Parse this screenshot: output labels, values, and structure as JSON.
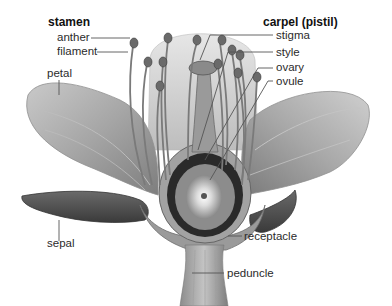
{
  "diagram": {
    "groups": {
      "stamen": {
        "heading": "stamen",
        "parts": [
          "anther",
          "filament"
        ]
      },
      "carpel": {
        "heading": "carpel (pistil)",
        "parts": [
          "stigma",
          "style",
          "ovary",
          "ovule"
        ]
      }
    },
    "labels": {
      "stamen": "stamen",
      "anther": "anther",
      "filament": "filament",
      "petal": "petal",
      "sepal": "sepal",
      "carpel": "carpel (pistil)",
      "stigma": "stigma",
      "style": "style",
      "ovary": "ovary",
      "ovule": "ovule",
      "receptacle": "receptacle",
      "peduncle": "peduncle"
    },
    "colors": {
      "background": "#ffffff",
      "text": "#2b2b2b",
      "leader_line": "#555555",
      "petal_light": "#d8d8d8",
      "petal_mid": "#a9a9a9",
      "sepal_dark": "#5a5a5a",
      "ovary_dark": "#2a2a2a"
    }
  }
}
